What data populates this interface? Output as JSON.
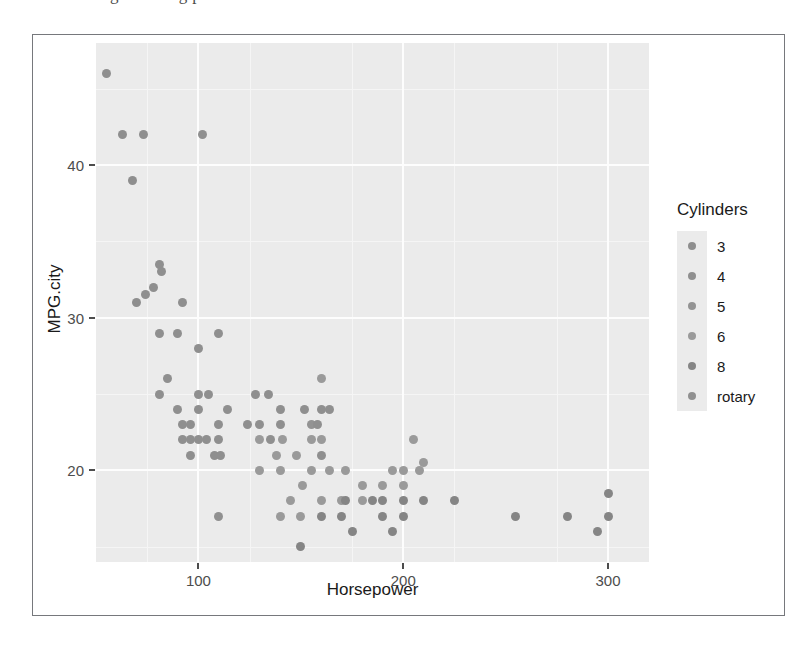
{
  "caption_bleed": "g    e   e  s  m  g    p   ",
  "axes": {
    "x_title": "Horsepower",
    "y_title": "MPG.city",
    "x_ticks": [
      100,
      200,
      300
    ],
    "y_ticks": [
      20,
      30,
      40
    ],
    "x_range": [
      50,
      320
    ],
    "y_range": [
      14,
      48
    ]
  },
  "legend": {
    "title": "Cylinders",
    "items": [
      {
        "label": "3",
        "color": "#8e8e8e"
      },
      {
        "label": "4",
        "color": "#8f8f8f"
      },
      {
        "label": "5",
        "color": "#939393"
      },
      {
        "label": "6",
        "color": "#9a9a9a"
      },
      {
        "label": "8",
        "color": "#858585"
      },
      {
        "label": "rotary",
        "color": "#909090"
      }
    ]
  },
  "chart_data": {
    "type": "scatter",
    "title": "",
    "xlabel": "Horsepower",
    "ylabel": "MPG.city",
    "xlim": [
      50,
      320
    ],
    "ylim": [
      14,
      48
    ],
    "grid": true,
    "legend_position": "right",
    "legend_title": "Cylinders",
    "color_by": "Cylinders",
    "categories": [
      "3",
      "4",
      "5",
      "6",
      "8",
      "rotary"
    ],
    "points": [
      {
        "x": 55,
        "y": 46,
        "c": "4"
      },
      {
        "x": 63,
        "y": 42,
        "c": "3"
      },
      {
        "x": 73,
        "y": 42,
        "c": "4"
      },
      {
        "x": 102,
        "y": 42,
        "c": "4"
      },
      {
        "x": 68,
        "y": 39,
        "c": "3"
      },
      {
        "x": 81,
        "y": 33.5,
        "c": "4"
      },
      {
        "x": 82,
        "y": 33,
        "c": "4"
      },
      {
        "x": 74,
        "y": 31.5,
        "c": "4"
      },
      {
        "x": 70,
        "y": 31,
        "c": "3"
      },
      {
        "x": 78,
        "y": 32,
        "c": "4"
      },
      {
        "x": 92,
        "y": 31,
        "c": "4"
      },
      {
        "x": 81,
        "y": 29,
        "c": "4"
      },
      {
        "x": 90,
        "y": 29,
        "c": "4"
      },
      {
        "x": 110,
        "y": 29,
        "c": "4"
      },
      {
        "x": 100,
        "y": 28,
        "c": "4"
      },
      {
        "x": 85,
        "y": 26,
        "c": "4"
      },
      {
        "x": 81,
        "y": 25,
        "c": "4"
      },
      {
        "x": 100,
        "y": 25,
        "c": "4"
      },
      {
        "x": 105,
        "y": 25,
        "c": "4"
      },
      {
        "x": 128,
        "y": 25,
        "c": "4"
      },
      {
        "x": 134,
        "y": 25,
        "c": "4"
      },
      {
        "x": 160,
        "y": 26,
        "c": "6"
      },
      {
        "x": 90,
        "y": 24,
        "c": "4"
      },
      {
        "x": 100,
        "y": 24,
        "c": "4"
      },
      {
        "x": 114,
        "y": 24,
        "c": "4"
      },
      {
        "x": 140,
        "y": 24,
        "c": "4"
      },
      {
        "x": 152,
        "y": 24,
        "c": "4"
      },
      {
        "x": 160,
        "y": 24,
        "c": "4"
      },
      {
        "x": 164,
        "y": 24,
        "c": "4"
      },
      {
        "x": 92,
        "y": 23,
        "c": "4"
      },
      {
        "x": 96,
        "y": 23,
        "c": "4"
      },
      {
        "x": 110,
        "y": 23,
        "c": "4"
      },
      {
        "x": 124,
        "y": 23,
        "c": "4"
      },
      {
        "x": 130,
        "y": 23,
        "c": "4"
      },
      {
        "x": 140,
        "y": 23,
        "c": "4"
      },
      {
        "x": 155,
        "y": 23,
        "c": "5"
      },
      {
        "x": 158,
        "y": 23,
        "c": "4"
      },
      {
        "x": 92,
        "y": 22,
        "c": "4"
      },
      {
        "x": 96,
        "y": 22,
        "c": "4"
      },
      {
        "x": 100,
        "y": 22,
        "c": "4"
      },
      {
        "x": 104,
        "y": 22,
        "c": "4"
      },
      {
        "x": 110,
        "y": 22,
        "c": "4"
      },
      {
        "x": 130,
        "y": 22,
        "c": "6"
      },
      {
        "x": 135,
        "y": 22,
        "c": "4"
      },
      {
        "x": 141,
        "y": 22,
        "c": "6"
      },
      {
        "x": 155,
        "y": 22,
        "c": "6"
      },
      {
        "x": 160,
        "y": 22,
        "c": "6"
      },
      {
        "x": 205,
        "y": 22,
        "c": "6"
      },
      {
        "x": 96,
        "y": 21,
        "c": "4"
      },
      {
        "x": 108,
        "y": 21,
        "c": "4"
      },
      {
        "x": 111,
        "y": 21,
        "c": "4"
      },
      {
        "x": 138,
        "y": 21,
        "c": "6"
      },
      {
        "x": 148,
        "y": 21,
        "c": "6"
      },
      {
        "x": 160,
        "y": 21,
        "c": "4"
      },
      {
        "x": 130,
        "y": 20,
        "c": "6"
      },
      {
        "x": 140,
        "y": 20,
        "c": "6"
      },
      {
        "x": 155,
        "y": 20,
        "c": "6"
      },
      {
        "x": 164,
        "y": 20,
        "c": "6"
      },
      {
        "x": 172,
        "y": 20,
        "c": "6"
      },
      {
        "x": 195,
        "y": 20,
        "c": "6"
      },
      {
        "x": 200,
        "y": 20,
        "c": "6"
      },
      {
        "x": 208,
        "y": 20,
        "c": "6"
      },
      {
        "x": 210,
        "y": 20.5,
        "c": "6"
      },
      {
        "x": 151,
        "y": 19,
        "c": "6"
      },
      {
        "x": 180,
        "y": 19,
        "c": "6"
      },
      {
        "x": 190,
        "y": 19,
        "c": "6"
      },
      {
        "x": 200,
        "y": 19,
        "c": "6"
      },
      {
        "x": 145,
        "y": 18,
        "c": "6"
      },
      {
        "x": 160,
        "y": 18,
        "c": "6"
      },
      {
        "x": 170,
        "y": 18,
        "c": "6"
      },
      {
        "x": 172,
        "y": 18,
        "c": "8"
      },
      {
        "x": 180,
        "y": 18,
        "c": "6"
      },
      {
        "x": 185,
        "y": 18,
        "c": "8"
      },
      {
        "x": 190,
        "y": 18,
        "c": "8"
      },
      {
        "x": 200,
        "y": 18,
        "c": "8"
      },
      {
        "x": 210,
        "y": 18,
        "c": "8"
      },
      {
        "x": 225,
        "y": 18,
        "c": "8"
      },
      {
        "x": 300,
        "y": 18.5,
        "c": "8"
      },
      {
        "x": 110,
        "y": 17,
        "c": "rotary"
      },
      {
        "x": 140,
        "y": 17,
        "c": "6"
      },
      {
        "x": 150,
        "y": 17,
        "c": "6"
      },
      {
        "x": 160,
        "y": 17,
        "c": "8"
      },
      {
        "x": 170,
        "y": 17,
        "c": "8"
      },
      {
        "x": 190,
        "y": 17,
        "c": "8"
      },
      {
        "x": 200,
        "y": 17,
        "c": "8"
      },
      {
        "x": 255,
        "y": 17,
        "c": "8"
      },
      {
        "x": 280,
        "y": 17,
        "c": "8"
      },
      {
        "x": 300,
        "y": 17,
        "c": "8"
      },
      {
        "x": 175,
        "y": 16,
        "c": "8"
      },
      {
        "x": 195,
        "y": 16,
        "c": "8"
      },
      {
        "x": 295,
        "y": 16,
        "c": "8"
      },
      {
        "x": 150,
        "y": 15,
        "c": "8"
      }
    ]
  }
}
